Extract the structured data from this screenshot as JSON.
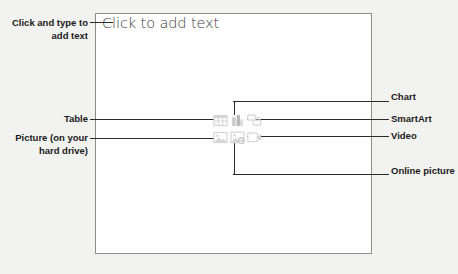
{
  "slide": {
    "body_placeholder_text": "Click to add text",
    "background_color": "#ffffff",
    "border_color": "#8d8d8d"
  },
  "page": {
    "background_color": "#f2f2f0",
    "leader_line_color": "#2b2b2b",
    "label_text_color": "#1a1a1a",
    "icon_color": "#d8d8d8"
  },
  "callouts": {
    "left": [
      {
        "id": "click-and-type",
        "text": "Click and type to add text",
        "align": "right"
      },
      {
        "id": "table",
        "text": "Table",
        "align": "right"
      },
      {
        "id": "picture-hard-drive",
        "text": "Picture (on your hard drive)",
        "align": "right"
      }
    ],
    "right": [
      {
        "id": "chart",
        "text": "Chart",
        "align": "left"
      },
      {
        "id": "smartart",
        "text": "SmartArt",
        "align": "left"
      },
      {
        "id": "video",
        "text": "Video",
        "align": "left"
      },
      {
        "id": "online-picture",
        "text": "Online picture",
        "align": "left"
      }
    ]
  },
  "content_icons": [
    {
      "id": "table-icon",
      "name": "table-icon",
      "row": 1,
      "col": 1
    },
    {
      "id": "chart-icon",
      "name": "chart-icon",
      "row": 1,
      "col": 2
    },
    {
      "id": "smartart-icon",
      "name": "smartart-icon",
      "row": 1,
      "col": 3
    },
    {
      "id": "picture-icon",
      "name": "picture-icon",
      "row": 2,
      "col": 1
    },
    {
      "id": "online-picture-icon",
      "name": "online-picture-icon",
      "row": 2,
      "col": 2
    },
    {
      "id": "video-icon",
      "name": "video-icon",
      "row": 2,
      "col": 3
    }
  ]
}
